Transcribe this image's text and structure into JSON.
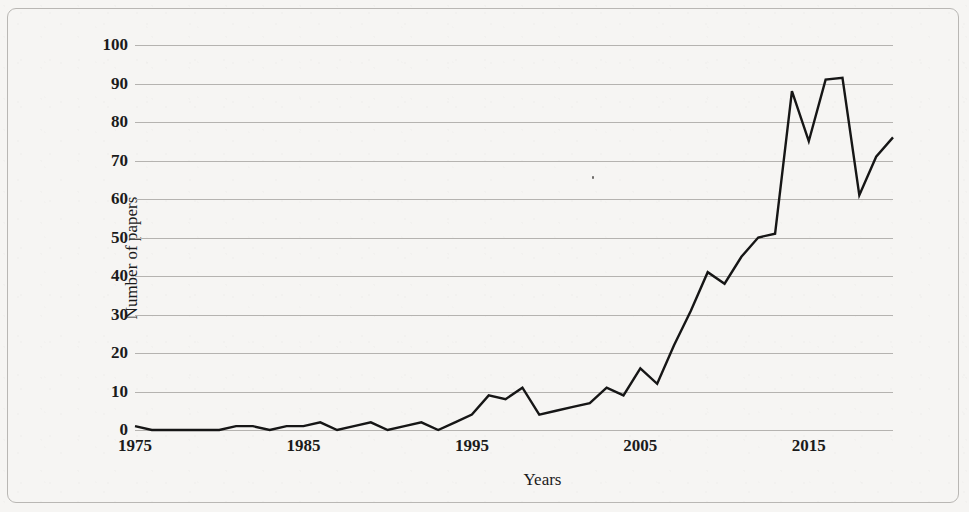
{
  "figure": {
    "background_color": "#f6f5f3",
    "frame_color": "#b9b7b4",
    "line_color": "#161616",
    "grid_color": "#b5b3b0",
    "text_color": "#1b1b1b"
  },
  "axes": {
    "y_title": "Number of papers",
    "x_title": "Years"
  },
  "chart_data": {
    "type": "line",
    "title": "",
    "subtitle": "",
    "xlabel": "Years",
    "ylabel": "Number of papers",
    "xlim": [
      1975,
      2020
    ],
    "ylim": [
      0,
      100
    ],
    "grid": true,
    "grid_axis": "y",
    "legend": false,
    "legend_position": "none",
    "y_ticks": [
      0,
      10,
      20,
      30,
      40,
      50,
      60,
      70,
      80,
      90,
      100
    ],
    "y_tick_labels": [
      "0",
      "10",
      "20",
      "30",
      "40",
      "50",
      "60",
      "70",
      "80",
      "90",
      "100"
    ],
    "x_ticks": [
      1975,
      1985,
      1995,
      2005,
      2015
    ],
    "x_tick_labels": [
      "1975",
      "1985",
      "1995",
      "2005",
      "2015"
    ],
    "x": [
      1975,
      1976,
      1977,
      1978,
      1979,
      1980,
      1981,
      1982,
      1983,
      1984,
      1985,
      1986,
      1987,
      1988,
      1989,
      1990,
      1991,
      1992,
      1993,
      1994,
      1995,
      1996,
      1997,
      1998,
      1999,
      2000,
      2001,
      2002,
      2003,
      2004,
      2005,
      2006,
      2007,
      2008,
      2009,
      2010,
      2011,
      2012,
      2013,
      2014,
      2015,
      2016,
      2017,
      2018,
      2019,
      2020
    ],
    "values": [
      1,
      0,
      0,
      0,
      0,
      0,
      1,
      1,
      0,
      1,
      1,
      2,
      0,
      1,
      2,
      0,
      1,
      2,
      0,
      2,
      4,
      9,
      8,
      11,
      4,
      5,
      6,
      7,
      11,
      9,
      16,
      12,
      22,
      31,
      41,
      38,
      45,
      50,
      51,
      88,
      75,
      91,
      91.5,
      61,
      71,
      76
    ],
    "series": [
      {
        "name": "Number of papers",
        "color": "#161616",
        "values": [
          1,
          0,
          0,
          0,
          0,
          0,
          1,
          1,
          0,
          1,
          1,
          2,
          0,
          1,
          2,
          0,
          1,
          2,
          0,
          2,
          4,
          9,
          8,
          11,
          4,
          5,
          6,
          7,
          11,
          9,
          16,
          12,
          22,
          31,
          41,
          38,
          45,
          50,
          51,
          88,
          75,
          91,
          91.5,
          61,
          71,
          76
        ]
      }
    ],
    "annotations": []
  }
}
